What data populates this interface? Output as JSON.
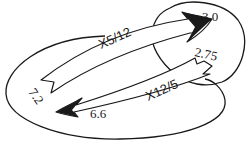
{
  "diagram": {
    "shapes": {
      "large_ellipse": {
        "label": ""
      },
      "small_circle": {
        "label": ""
      }
    },
    "values": {
      "left_value": "7.2",
      "top_right_value": "3.0",
      "inner_right_value": "2.75",
      "bottom_value": "6.6"
    },
    "arrows": [
      {
        "label": "X5/12",
        "from": "7.2",
        "to": "3.0"
      },
      {
        "label": "X12/5",
        "from": "2.75",
        "to": "6.6"
      }
    ],
    "colors": {
      "stroke": "#1a1a1a",
      "fill": "#ffffff"
    }
  }
}
